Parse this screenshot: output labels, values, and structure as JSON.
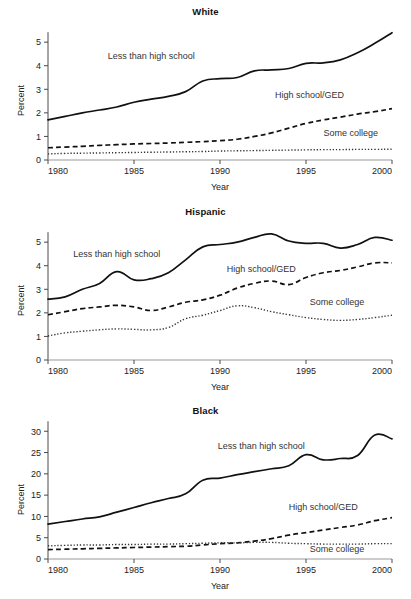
{
  "figure": {
    "series_names": [
      "Less than high school",
      "High school/GED",
      "Some college"
    ],
    "x_axis_title": "Year",
    "y_axis_title": "Percent"
  },
  "chart_data": [
    {
      "type": "line",
      "title": "White",
      "xlabel": "Year",
      "ylabel": "Percent",
      "xlim": [
        1980,
        2000
      ],
      "ylim": [
        0,
        5.6
      ],
      "xticks": [
        "1980",
        "1985",
        "1990",
        "1995",
        "2000"
      ],
      "yticks": [
        "0",
        "1",
        "2",
        "3",
        "4",
        "5"
      ],
      "grid": false,
      "legend_position": "inline-annotation",
      "x": [
        1980,
        1981,
        1982,
        1983,
        1984,
        1985,
        1986,
        1987,
        1988,
        1989,
        1990,
        1991,
        1992,
        1993,
        1994,
        1995,
        1996,
        1997,
        1998,
        1999,
        2000
      ],
      "series": [
        {
          "name": "Less than high school",
          "style": "solid",
          "values": [
            1.7,
            1.85,
            2.0,
            2.12,
            2.25,
            2.45,
            2.58,
            2.7,
            2.9,
            3.35,
            3.45,
            3.5,
            3.78,
            3.82,
            3.88,
            4.1,
            4.12,
            4.25,
            4.55,
            4.95,
            5.4
          ],
          "annotation": "Less than high school"
        },
        {
          "name": "High school/GED",
          "style": "dashed",
          "values": [
            0.52,
            0.55,
            0.58,
            0.62,
            0.65,
            0.68,
            0.7,
            0.72,
            0.75,
            0.78,
            0.82,
            0.88,
            1.0,
            1.15,
            1.35,
            1.55,
            1.7,
            1.82,
            1.95,
            2.05,
            2.18
          ],
          "annotation": "High school/GED"
        },
        {
          "name": "Some college",
          "style": "dotted",
          "values": [
            0.26,
            0.28,
            0.29,
            0.3,
            0.31,
            0.32,
            0.33,
            0.34,
            0.35,
            0.36,
            0.38,
            0.39,
            0.4,
            0.41,
            0.42,
            0.43,
            0.44,
            0.44,
            0.45,
            0.45,
            0.46
          ],
          "annotation": "Some college"
        }
      ]
    },
    {
      "type": "line",
      "title": "Hispanic",
      "xlabel": "Year",
      "ylabel": "Percent",
      "xlim": [
        1980,
        2000
      ],
      "ylim": [
        0,
        5.6
      ],
      "xticks": [
        "1980",
        "1985",
        "1990",
        "1995",
        "2000"
      ],
      "yticks": [
        "0",
        "1",
        "2",
        "3",
        "4",
        "5"
      ],
      "grid": false,
      "legend_position": "inline-annotation",
      "x": [
        1980,
        1981,
        1982,
        1983,
        1984,
        1985,
        1986,
        1987,
        1988,
        1989,
        1990,
        1991,
        1992,
        1993,
        1994,
        1995,
        1996,
        1997,
        1998,
        1999,
        2000
      ],
      "series": [
        {
          "name": "Less than high school",
          "style": "solid",
          "values": [
            2.58,
            2.68,
            3.0,
            3.25,
            3.75,
            3.4,
            3.45,
            3.7,
            4.25,
            4.8,
            4.9,
            5.0,
            5.2,
            5.35,
            5.05,
            4.95,
            4.95,
            4.75,
            4.9,
            5.2,
            5.08
          ],
          "annotation": "Less than high school"
        },
        {
          "name": "High school/GED",
          "style": "dashed",
          "values": [
            1.92,
            2.05,
            2.18,
            2.25,
            2.32,
            2.25,
            2.1,
            2.25,
            2.45,
            2.55,
            2.75,
            3.05,
            3.25,
            3.35,
            3.2,
            3.5,
            3.7,
            3.8,
            3.95,
            4.12,
            4.12
          ],
          "annotation": "High school/GED"
        },
        {
          "name": "Some college",
          "style": "dotted",
          "values": [
            1.02,
            1.15,
            1.22,
            1.28,
            1.32,
            1.3,
            1.28,
            1.38,
            1.75,
            1.9,
            2.1,
            2.3,
            2.22,
            2.05,
            1.92,
            1.8,
            1.72,
            1.68,
            1.72,
            1.8,
            1.9
          ],
          "annotation": "Some college"
        }
      ]
    },
    {
      "type": "line",
      "title": "Black",
      "xlabel": "Year",
      "ylabel": "Percent",
      "xlim": [
        1980,
        2000
      ],
      "ylim": [
        0,
        31
      ],
      "xticks": [
        "1980",
        "1985",
        "1990",
        "1995",
        "2000"
      ],
      "yticks": [
        "0",
        "5",
        "10",
        "15",
        "20",
        "25",
        "30"
      ],
      "grid": false,
      "legend_position": "inline-annotation",
      "x": [
        1980,
        1981,
        1982,
        1983,
        1984,
        1985,
        1986,
        1987,
        1988,
        1989,
        1990,
        1991,
        1992,
        1993,
        1994,
        1995,
        1996,
        1997,
        1998,
        1999,
        2000
      ],
      "series": [
        {
          "name": "Less than high school",
          "style": "solid",
          "values": [
            8.2,
            8.8,
            9.4,
            9.9,
            11.0,
            12.1,
            13.2,
            14.2,
            15.3,
            18.5,
            19.0,
            19.8,
            20.5,
            21.2,
            21.9,
            24.5,
            23.3,
            23.6,
            24.3,
            29.1,
            28.2
          ],
          "annotation": "Less than high school"
        },
        {
          "name": "High school/GED",
          "style": "dashed",
          "values": [
            2.2,
            2.3,
            2.4,
            2.5,
            2.6,
            2.7,
            2.8,
            2.9,
            3.0,
            3.3,
            3.6,
            3.8,
            4.2,
            4.8,
            5.6,
            6.2,
            6.8,
            7.4,
            8.0,
            9.0,
            9.7
          ],
          "annotation": "High school/GED"
        },
        {
          "name": "Some college",
          "style": "dotted",
          "values": [
            3.1,
            3.2,
            3.3,
            3.3,
            3.4,
            3.4,
            3.5,
            3.5,
            3.6,
            3.7,
            3.8,
            3.8,
            3.9,
            3.9,
            3.7,
            3.6,
            3.5,
            3.5,
            3.5,
            3.6,
            3.6
          ],
          "annotation": "Some college"
        }
      ]
    }
  ]
}
